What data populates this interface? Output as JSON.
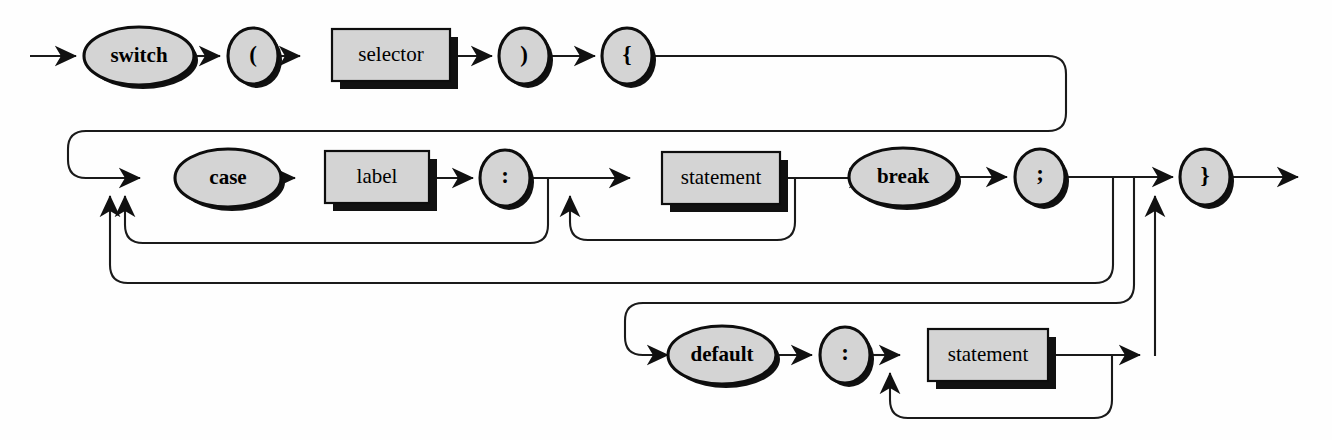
{
  "diagram": {
    "kind": "railroad-syntax-diagram",
    "colors": {
      "node_fill": "#d4d4d4",
      "stroke": "#0d0d0d",
      "shadow": "#111111",
      "background": "#ffffff"
    },
    "nodes": [
      {
        "id": "switch",
        "label": "switch",
        "shape": "ellipse",
        "style": "terminal",
        "cx": 139,
        "cy": 56,
        "rx": 55,
        "ry": 29
      },
      {
        "id": "lparen",
        "label": "(",
        "shape": "ellipse",
        "style": "terminal",
        "cx": 253,
        "cy": 56,
        "rx": 25,
        "ry": 28
      },
      {
        "id": "selector",
        "label": "selector",
        "shape": "box",
        "style": "nonterminal",
        "x": 332,
        "y": 29,
        "w": 118,
        "h": 52
      },
      {
        "id": "rparen",
        "label": ")",
        "shape": "ellipse",
        "style": "terminal",
        "cx": 524,
        "cy": 56,
        "rx": 25,
        "ry": 28
      },
      {
        "id": "lbrace",
        "label": "{",
        "shape": "ellipse",
        "style": "terminal",
        "cx": 627,
        "cy": 56,
        "rx": 25,
        "ry": 28
      },
      {
        "id": "case",
        "label": "case",
        "shape": "ellipse",
        "style": "terminal",
        "cx": 228,
        "cy": 178,
        "rx": 53,
        "ry": 29
      },
      {
        "id": "label",
        "label": "label",
        "shape": "box",
        "style": "nonterminal",
        "x": 325,
        "y": 151,
        "w": 104,
        "h": 52
      },
      {
        "id": "colon1",
        "label": ":",
        "shape": "ellipse",
        "style": "terminal",
        "cx": 505,
        "cy": 178,
        "rx": 25,
        "ry": 28
      },
      {
        "id": "statement1",
        "label": "statement",
        "shape": "box",
        "style": "nonterminal",
        "x": 662,
        "y": 152,
        "w": 118,
        "h": 52
      },
      {
        "id": "break",
        "label": "break",
        "shape": "ellipse",
        "style": "terminal",
        "cx": 903,
        "cy": 177,
        "rx": 54,
        "ry": 29
      },
      {
        "id": "semicolon",
        "label": ";",
        "shape": "ellipse",
        "style": "terminal",
        "cx": 1040,
        "cy": 177,
        "rx": 25,
        "ry": 28
      },
      {
        "id": "rbrace",
        "label": "}",
        "shape": "ellipse",
        "style": "terminal",
        "cx": 1205,
        "cy": 177,
        "rx": 25,
        "ry": 28
      },
      {
        "id": "default",
        "label": "default",
        "shape": "ellipse",
        "style": "terminal",
        "cx": 722,
        "cy": 355,
        "rx": 54,
        "ry": 29
      },
      {
        "id": "colon2",
        "label": ":",
        "shape": "ellipse",
        "style": "terminal",
        "cx": 845,
        "cy": 355,
        "rx": 25,
        "ry": 28
      },
      {
        "id": "statement2",
        "label": "statement",
        "shape": "box",
        "style": "nonterminal",
        "x": 928,
        "y": 329,
        "w": 120,
        "h": 52
      }
    ],
    "entry_label": "entry-arrow",
    "exit_label": "exit-arrow"
  }
}
